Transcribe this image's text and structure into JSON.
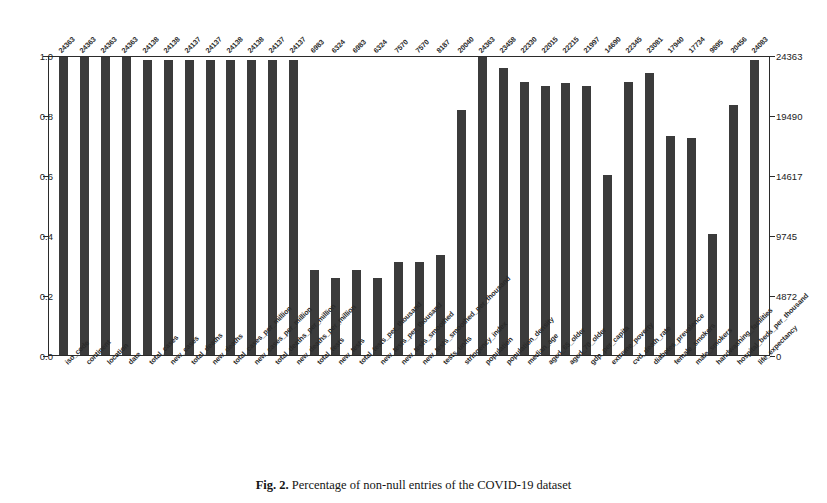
{
  "figure": {
    "caption_number": "Fig. 2.",
    "caption_text": "Percentage of non-null entries of the COVID-19 dataset"
  },
  "axes": {
    "left_ticks": [
      "1.0",
      "0.8",
      "0.6",
      "0.4",
      "0.2",
      "0.0"
    ],
    "right_ticks": [
      "24363",
      "19490",
      "14617",
      "9745",
      "4872",
      "0"
    ],
    "left_label": "",
    "right_label": "",
    "xlabel": ""
  },
  "chart_data": {
    "type": "bar",
    "title": "",
    "xlabel": "",
    "ylabel": "",
    "ylim": [
      0,
      1
    ],
    "y2lim": [
      0,
      24363
    ],
    "grid": false,
    "legend": "none",
    "bar_color": "#3b3b3b",
    "total_rows": 24363,
    "categories": [
      "iso_code",
      "continent",
      "location",
      "date",
      "total_cases",
      "new_cases",
      "total_deaths",
      "new_deaths",
      "total_cases_per_million",
      "new_cases_per_million",
      "total_deaths_per_million",
      "new_deaths_per_million",
      "total_tests",
      "new_tests",
      "total_tests_per_thousand",
      "new_tests_per_thousand",
      "new_tests_smoothed",
      "new_tests_smoothed_per_thousand",
      "tests_units",
      "stringency_index",
      "population",
      "population_density",
      "median_age",
      "aged_65_older",
      "aged_70_older",
      "gdp_per_capita",
      "extreme_poverty",
      "cvd_death_rate",
      "diabetes_prevalence",
      "female_smokers",
      "male_smokers",
      "handwashing_facilities",
      "hospital_beds_per_thousand",
      "life_expectancy"
    ],
    "counts": [
      24363,
      24363,
      24363,
      24363,
      24138,
      24138,
      24137,
      24137,
      24138,
      24138,
      24137,
      24137,
      6983,
      6324,
      6983,
      6324,
      7570,
      7570,
      8187,
      20040,
      24363,
      23458,
      22330,
      22015,
      22215,
      21997,
      14690,
      22345,
      23081,
      17940,
      17734,
      9895,
      20456,
      24083
    ],
    "values": [
      1.0,
      1.0,
      1.0,
      1.0,
      0.9908,
      0.9908,
      0.9907,
      0.9907,
      0.9908,
      0.9908,
      0.9907,
      0.9907,
      0.2866,
      0.2596,
      0.2866,
      0.2596,
      0.3107,
      0.3107,
      0.336,
      0.8226,
      1.0,
      0.9629,
      0.9166,
      0.9037,
      0.9119,
      0.9029,
      0.603,
      0.9172,
      0.9474,
      0.7364,
      0.7279,
      0.4062,
      0.8397,
      0.9885
    ]
  }
}
